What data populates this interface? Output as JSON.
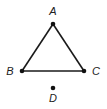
{
  "diagram": {
    "type": "geometry",
    "points": [
      {
        "label": "A",
        "x": 53,
        "y": 24,
        "lx": 53,
        "ly": 15
      },
      {
        "label": "B",
        "x": 22,
        "y": 71,
        "lx": 10,
        "ly": 75
      },
      {
        "label": "C",
        "x": 84,
        "y": 71,
        "lx": 96,
        "ly": 75
      },
      {
        "label": "D",
        "x": 53,
        "y": 88,
        "lx": 53,
        "ly": 102
      }
    ],
    "segments": [
      [
        "A",
        "B"
      ],
      [
        "B",
        "C"
      ],
      [
        "C",
        "A"
      ]
    ],
    "colors": {
      "line": "#1a1a1a",
      "point": "#111111"
    }
  }
}
